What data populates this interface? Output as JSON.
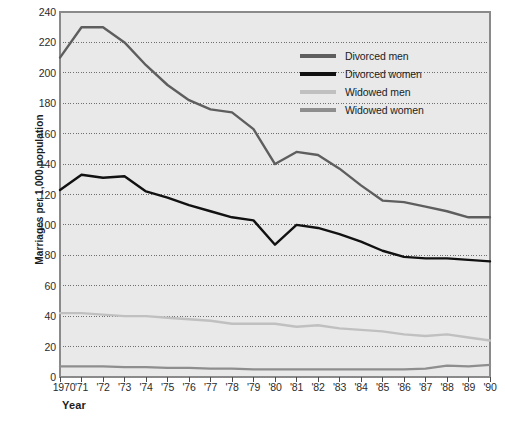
{
  "chart_data": {
    "type": "line",
    "title": "",
    "xlabel": "Year",
    "ylabel": "Marriages per 1,000 population",
    "ylim": [
      0,
      240
    ],
    "ytick_values": [
      0,
      20,
      40,
      60,
      80,
      100,
      120,
      140,
      160,
      180,
      200,
      220,
      240
    ],
    "ytick_labels": [
      "0",
      "20",
      "40",
      "60",
      "80",
      "100",
      "120",
      "140",
      "160",
      "180",
      "200",
      "220",
      "240"
    ],
    "grid": "horizontal-dotted",
    "legend_position": "upper-right-inside",
    "x": [
      1970,
      1971,
      1972,
      1973,
      1974,
      1975,
      1976,
      1977,
      1978,
      1979,
      1980,
      1981,
      1982,
      1983,
      1984,
      1985,
      1986,
      1987,
      1988,
      1989,
      1990
    ],
    "categories": [
      "1970",
      "'71",
      "'72",
      "'73",
      "'74",
      "'75",
      "'76",
      "'77",
      "'78",
      "'79",
      "'80",
      "'81",
      "'82",
      "'83",
      "'84",
      "'85",
      "'86",
      "'87",
      "'88",
      "'89",
      "'90"
    ],
    "series": [
      {
        "name": "Divorced men",
        "color": "#5e5e5e",
        "values": [
          210,
          230,
          230,
          220,
          205,
          192,
          182,
          176,
          174,
          163,
          140,
          148,
          146,
          137,
          126,
          116,
          115,
          112,
          109,
          105,
          105
        ]
      },
      {
        "name": "Divorced women",
        "color": "#111111",
        "values": [
          123,
          133,
          131,
          132,
          122,
          118,
          113,
          109,
          105,
          103,
          87,
          100,
          98,
          94,
          89,
          83,
          79,
          78,
          78,
          77,
          76
        ]
      },
      {
        "name": "Widowed men",
        "color": "#c0c0c0",
        "values": [
          42,
          42,
          41,
          40,
          40,
          39,
          38,
          37,
          35,
          35,
          35,
          33,
          34,
          32,
          31,
          30,
          28,
          27,
          28,
          26,
          24
        ]
      },
      {
        "name": "Widowed women",
        "color": "#8e8e8e",
        "values": [
          7,
          7,
          7,
          6.5,
          6.5,
          6,
          6,
          5.5,
          5.5,
          5,
          5,
          5,
          5,
          5,
          5,
          5,
          5,
          5.5,
          7.5,
          7,
          8
        ]
      }
    ]
  },
  "legend": {
    "items": [
      {
        "label": "Divorced men",
        "color": "#5e5e5e"
      },
      {
        "label": "Divorced women",
        "color": "#111111"
      },
      {
        "label": "Widowed men",
        "color": "#c0c0c0"
      },
      {
        "label": "Widowed women",
        "color": "#8e8e8e"
      }
    ]
  },
  "plot_style": {
    "background": "#e9e9e9",
    "border": "#8a8a8a",
    "gridline": "#6f6f6f"
  }
}
